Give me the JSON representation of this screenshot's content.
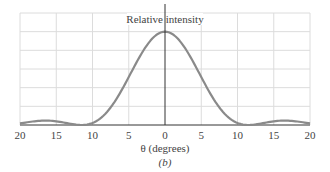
{
  "chart_data": {
    "type": "line",
    "title": "",
    "ylabel": "Relative intensity",
    "xlabel": "θ (degrees)",
    "caption": "(b)",
    "xlim": [
      -20,
      20
    ],
    "ylim": [
      0,
      1.2
    ],
    "x_tick_values": [
      -20,
      -15,
      -10,
      -5,
      0,
      5,
      10,
      15,
      20
    ],
    "x_tick_labels": [
      "20",
      "15",
      "10",
      "5",
      "0",
      "5",
      "10",
      "15",
      "20"
    ],
    "y_ticks_labeled": false,
    "grid": true,
    "legend": null,
    "series": [
      {
        "name": "Relative intensity",
        "x": [
          -20,
          -19,
          -18,
          -17,
          -16,
          -15,
          -14,
          -13,
          -12,
          -11.5,
          -11,
          -10,
          -9,
          -8,
          -7,
          -6,
          -5,
          -4,
          -3,
          -2,
          -1,
          0,
          1,
          2,
          3,
          4,
          5,
          6,
          7,
          8,
          9,
          10,
          11,
          11.5,
          12,
          13,
          14,
          15,
          16,
          17,
          18,
          19,
          20
        ],
        "y": [
          0.018,
          0.03,
          0.04,
          0.046,
          0.047,
          0.042,
          0.03,
          0.015,
          0.002,
          0.0,
          0.002,
          0.025,
          0.085,
          0.19,
          0.32,
          0.46,
          0.6,
          0.73,
          0.84,
          0.93,
          0.98,
          1.0,
          0.98,
          0.93,
          0.84,
          0.73,
          0.6,
          0.46,
          0.32,
          0.19,
          0.085,
          0.025,
          0.002,
          0.0,
          0.002,
          0.015,
          0.03,
          0.042,
          0.047,
          0.046,
          0.04,
          0.03,
          0.018
        ]
      }
    ]
  },
  "labels": {
    "ylabel": "Relative intensity",
    "xlabel": "θ (degrees)",
    "caption": "(b)",
    "ticks": [
      "20",
      "15",
      "10",
      "5",
      "0",
      "5",
      "10",
      "15",
      "20"
    ]
  }
}
